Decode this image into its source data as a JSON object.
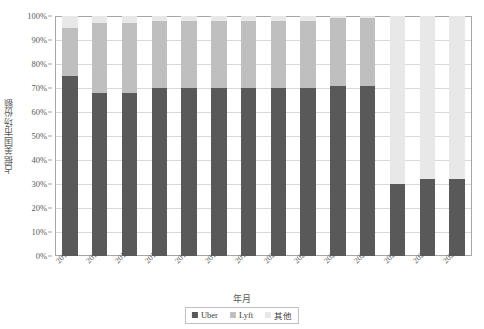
{
  "chart_data": {
    "type": "bar",
    "subtype": "100% stacked column",
    "title": "",
    "xlabel": "年月",
    "ylabel": "占据美国市场份额",
    "ylim": [
      0,
      100
    ],
    "ytick_labels": [
      "0%",
      "10%",
      "20%",
      "30%",
      "40%",
      "50%",
      "60%",
      "70%",
      "80%",
      "90%",
      "100%"
    ],
    "ytick_values": [
      0,
      10,
      20,
      30,
      40,
      50,
      60,
      70,
      80,
      90,
      100
    ],
    "grid": true,
    "legend_position": "bottom-center",
    "categories": [
      "2017.09",
      "2018.10",
      "2019.05",
      "2019.08",
      "2019.10",
      "2019.11",
      "2019.12",
      "2020.01",
      "2020.02",
      "2020.03",
      "2020.04",
      "2020.05",
      "2020.06",
      "2020.07"
    ],
    "series": [
      {
        "name": "Uber",
        "color": "#595959",
        "values": [
          75,
          68,
          68,
          70,
          70,
          70,
          70,
          70,
          70,
          71,
          71,
          30,
          32,
          32
        ]
      },
      {
        "name": "Lyft",
        "color": "#bfbfbf",
        "values": [
          20,
          29,
          29,
          28,
          28,
          28,
          28,
          28,
          28,
          28,
          28,
          0,
          0,
          0
        ]
      },
      {
        "name": "其他",
        "color": "#e8e8e8",
        "values": [
          5,
          3,
          3,
          2,
          2,
          2,
          2,
          2,
          2,
          1,
          1,
          70,
          68,
          68
        ]
      }
    ]
  },
  "legend": {
    "items": [
      {
        "label": "Uber",
        "color": "#595959"
      },
      {
        "label": "Lyft",
        "color": "#bfbfbf"
      },
      {
        "label": "其他",
        "color": "#e8e8e8"
      }
    ]
  },
  "axes": {
    "y_title": "占据美国市场份额",
    "x_title": "年月"
  },
  "colors": {
    "frame": "#a6a6a6",
    "grid": "#d9d9d9",
    "text": "#595959",
    "background": "#ffffff"
  }
}
